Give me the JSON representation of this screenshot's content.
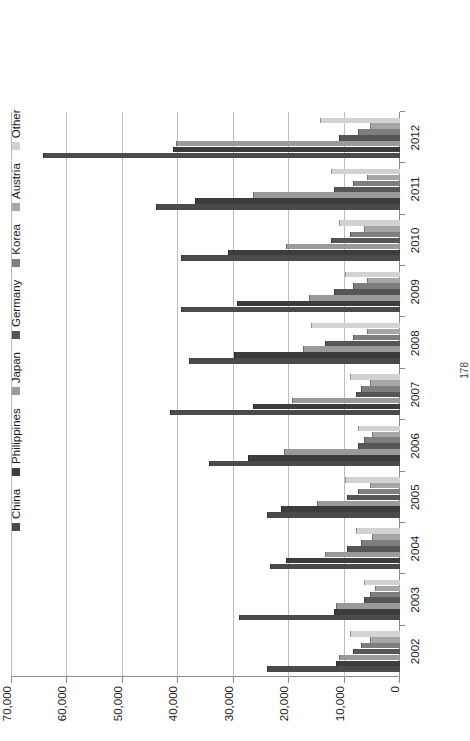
{
  "page": {
    "number": "178"
  },
  "chart_data": {
    "type": "bar",
    "title": "",
    "subtitle": "",
    "xlabel": "",
    "ylabel": "",
    "orientation": "vertical-rotated",
    "grid": true,
    "legend_position": "top",
    "ylim": [
      0,
      70000
    ],
    "yticks": [
      0,
      10000,
      20000,
      30000,
      40000,
      50000,
      60000,
      70000
    ],
    "ytick_labels": [
      "0",
      "10,000",
      "20,000",
      "30,000",
      "40,000",
      "50,000",
      "60,000",
      "70,000"
    ],
    "categories": [
      "2002",
      "2003",
      "2004",
      "2005",
      "2006",
      "2007",
      "2008",
      "2009",
      "2010",
      "2011",
      "2012"
    ],
    "series": [
      {
        "name": "China",
        "color": "#4a4a4a",
        "values": [
          24000,
          29000,
          23500,
          24000,
          34500,
          41500,
          38000,
          39500,
          39500,
          44000,
          64500
        ]
      },
      {
        "name": "Philippines",
        "color": "#3c3c3c",
        "values": [
          11500,
          12000,
          20500,
          21500,
          27500,
          26500,
          30000,
          29500,
          31000,
          37000,
          41000
        ]
      },
      {
        "name": "Japan",
        "color": "#9a9a9a",
        "values": [
          11000,
          11500,
          13500,
          15000,
          21000,
          19500,
          17500,
          16500,
          20500,
          26500,
          40500
        ]
      },
      {
        "name": "Germany",
        "color": "#565656",
        "values": [
          8500,
          6500,
          9500,
          9500,
          7500,
          8000,
          13500,
          12000,
          12500,
          12000,
          11000
        ]
      },
      {
        "name": "Korea",
        "color": "#7e7e7e",
        "values": [
          7000,
          5500,
          7000,
          7500,
          6500,
          7000,
          8500,
          8500,
          9000,
          8500,
          7500
        ]
      },
      {
        "name": "Austria",
        "color": "#a6a6a6",
        "values": [
          5500,
          4500,
          5000,
          5500,
          5000,
          5500,
          6000,
          6000,
          6500,
          6000,
          5500
        ]
      },
      {
        "name": "Other",
        "color": "#d2d2d2",
        "values": [
          9000,
          6500,
          8000,
          10000,
          7500,
          9000,
          16000,
          10000,
          11000,
          12500,
          14500
        ]
      }
    ]
  }
}
